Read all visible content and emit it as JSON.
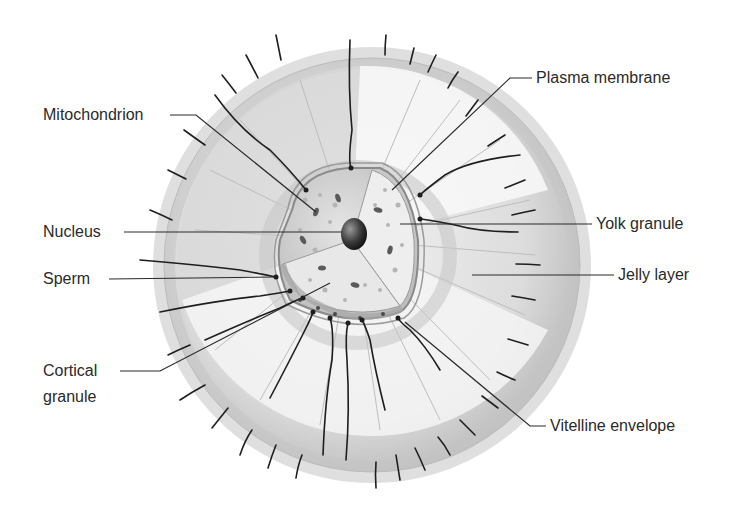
{
  "diagram": {
    "labels": {
      "mitochondrion": "Mitochondrion",
      "nucleus": "Nucleus",
      "sperm": "Sperm",
      "cortical_line1": "Cortical",
      "cortical_line2": "granule",
      "plasma_membrane": "Plasma membrane",
      "yolk_granule": "Yolk granule",
      "jelly_layer": "Jelly layer",
      "vitelline_envelope": "Vitelline envelope"
    },
    "colors": {
      "background": "#ffffff",
      "jelly_outer": "#c9c9c9",
      "jelly_inner": "#e6e6e6",
      "jelly_cut": "#f6f6f6",
      "cytoplasm": "#d6d6d6",
      "nucleus": "#3a3a3a",
      "sperm": "#1e1e1e",
      "leader_line": "#2a2a2a",
      "text": "#2a2a2a"
    }
  }
}
